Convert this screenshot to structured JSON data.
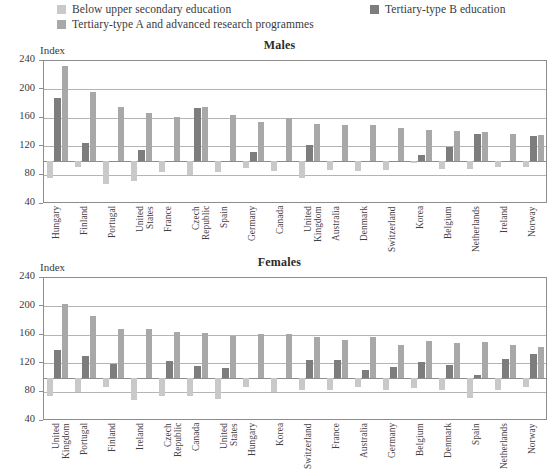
{
  "legend": {
    "items": [
      {
        "label": "Below upper secondary education",
        "color": "#c9c9c9",
        "name": "legend-below-upper-secondary"
      },
      {
        "label": "Tertiary-type B education",
        "color": "#7d7d7d",
        "name": "legend-tertiary-type-b"
      },
      {
        "label": "Tertiary-type A and advanced research programmes",
        "color": "#a8a8a8",
        "name": "legend-tertiary-type-a"
      }
    ]
  },
  "axis": {
    "index_label": "Index",
    "ticks": [
      "240",
      "200",
      "160",
      "120",
      "80",
      "40"
    ]
  },
  "chart_data": [
    {
      "type": "bar",
      "title": "Males",
      "xlabel": "",
      "ylabel": "Index",
      "ylim": [
        40,
        240
      ],
      "yticks": [
        40,
        80,
        120,
        160,
        200,
        240
      ],
      "grid": true,
      "baseline": 100,
      "legend_position": "top",
      "categories": [
        "Hungary",
        "Finland",
        "Portugal",
        "United States",
        "France",
        "Czech Republic",
        "Spain",
        "Germany",
        "Canada",
        "United Kingdom",
        "Australia",
        "Denmark",
        "Switzerland",
        "Korea",
        "Belgium",
        "Netherlands",
        "Ireland",
        "Norway"
      ],
      "series": [
        {
          "name": "Below upper secondary education",
          "color": "#c9c9c9",
          "values": [
            76,
            92,
            68,
            72,
            85,
            80,
            85,
            90,
            86,
            76,
            87,
            86,
            88,
            97,
            89,
            89,
            92,
            92
          ]
        },
        {
          "name": "Tertiary-type B education",
          "color": "#7d7d7d",
          "values": [
            188,
            126,
            100,
            115,
            100,
            174,
            100,
            113,
            100,
            122,
            100,
            100,
            100,
            108,
            120,
            138,
            100,
            135
          ]
        },
        {
          "name": "Tertiary-type A and advanced research programmes",
          "color": "#a8a8a8",
          "values": [
            233,
            197,
            175,
            167,
            162,
            176,
            165,
            155,
            160,
            152,
            151,
            150,
            146,
            143,
            142,
            141,
            138,
            136
          ]
        }
      ]
    },
    {
      "type": "bar",
      "title": "Females",
      "xlabel": "",
      "ylabel": "Index",
      "ylim": [
        40,
        240
      ],
      "yticks": [
        40,
        80,
        120,
        160,
        200,
        240
      ],
      "grid": true,
      "baseline": 100,
      "legend_position": "top",
      "categories": [
        "United Kingdom",
        "Portugal",
        "Finland",
        "Ireland",
        "Czech Republic",
        "Canada",
        "United States",
        "Hungary",
        "Korea",
        "Switzerland",
        "France",
        "Australia",
        "Germany",
        "Belgium",
        "Denmark",
        "Spain",
        "Netherlands",
        "Norway"
      ],
      "series": [
        {
          "name": "Below upper secondary education",
          "color": "#c9c9c9",
          "values": [
            75,
            80,
            88,
            70,
            75,
            75,
            71,
            88,
            80,
            83,
            83,
            88,
            83,
            86,
            83,
            72,
            83,
            88
          ]
        },
        {
          "name": "Tertiary-type B education",
          "color": "#7d7d7d",
          "values": [
            140,
            131,
            120,
            100,
            124,
            117,
            114,
            100,
            100,
            126,
            125,
            112,
            116,
            122,
            118,
            104,
            127,
            134
          ]
        },
        {
          "name": "Tertiary-type A and advanced research programmes",
          "color": "#a8a8a8",
          "values": [
            203,
            187,
            168,
            168,
            165,
            163,
            159,
            162,
            162,
            158,
            153,
            157,
            146,
            152,
            149,
            151,
            146,
            144
          ]
        }
      ]
    }
  ]
}
